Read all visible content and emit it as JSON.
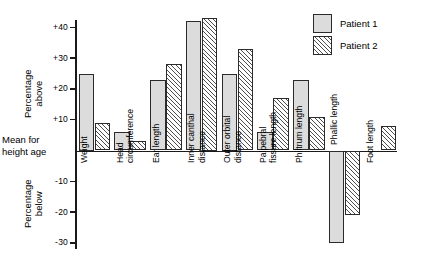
{
  "chart_data": {
    "type": "bar",
    "title": "",
    "xlabel": "",
    "ylabel": "Percentage above / Percentage below",
    "ylim": [
      -30,
      45
    ],
    "yticks": [
      40,
      30,
      20,
      10,
      -10,
      -20,
      -30
    ],
    "ytick_labels": [
      "+40",
      "+30",
      "+20",
      "+10",
      "-10",
      "-20",
      "-30"
    ],
    "zero_label": "Mean for height age",
    "grid": false,
    "legend_position": "top-right",
    "categories": [
      "Weight",
      "Head circumference",
      "Ear length",
      "Inner canthal distance",
      "Outer orbital distance",
      "Palpebral fissure length",
      "Philtrum length",
      "Phallic length",
      "Foot length"
    ],
    "category_lines": [
      [
        "Weight"
      ],
      [
        "Head",
        "circumference"
      ],
      [
        "Ear length"
      ],
      [
        "Inner canthal",
        "distance"
      ],
      [
        "Outer orbital",
        "distance"
      ],
      [
        "Palpebral",
        "fissure length"
      ],
      [
        "Philtrum length"
      ],
      [
        "Phallic length"
      ],
      [
        "Foot length"
      ]
    ],
    "series": [
      {
        "name": "Patient 1",
        "values": [
          25,
          6,
          23,
          42,
          25,
          6,
          23,
          -30,
          null
        ]
      },
      {
        "name": "Patient 2",
        "values": [
          9,
          3,
          28,
          43,
          33,
          17,
          11,
          -21,
          8
        ]
      }
    ]
  },
  "axis": {
    "above_title": "Percentage\nabove",
    "above_title_line1": "Percentage",
    "above_title_line2": "above",
    "below_title_line1": "Percentage",
    "below_title_line2": "below",
    "zero_line1": "Mean for",
    "zero_line2": "height age"
  },
  "legend": {
    "items": [
      {
        "label": "Patient 1",
        "pattern": "stipple",
        "color": "#dcdcdc"
      },
      {
        "label": "Patient 2",
        "pattern": "diagonal-hatch",
        "color": "#ffffff"
      }
    ]
  }
}
